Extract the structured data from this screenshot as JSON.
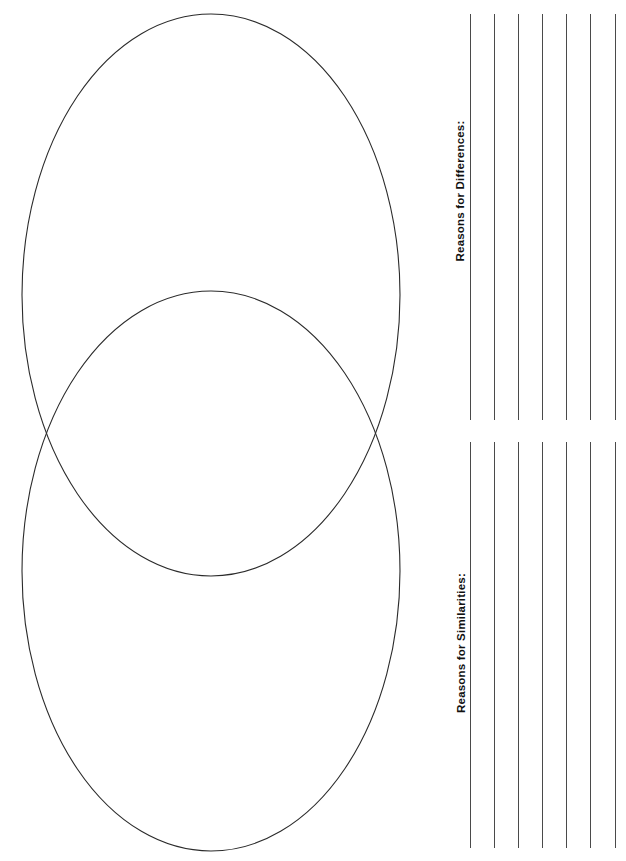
{
  "page": {
    "background_color": "#ffffff",
    "width": 626,
    "height": 861
  },
  "venn": {
    "name": "venn-diagram",
    "stroke_color": "#2b2b2b",
    "fill": "none",
    "stroke_width": 1.1,
    "ellipses": [
      {
        "id": "top-ellipse",
        "label": "",
        "cx": 211,
        "cy": 295,
        "rx": 189,
        "ry": 281
      },
      {
        "id": "bottom-ellipse",
        "label": "",
        "cx": 211,
        "cy": 571,
        "rx": 189,
        "ry": 280
      }
    ]
  },
  "writing_panel": {
    "sections": [
      {
        "id": "differences",
        "label": "Reasons for Differences:",
        "line_count": 7,
        "line_color": "#4a4a4a",
        "line_top": 14,
        "line_height": 406,
        "line_x_positions": [
          50,
          74,
          98,
          122,
          146,
          170,
          195
        ]
      },
      {
        "id": "similarities",
        "label": "Reasons for Similarities:",
        "line_count": 7,
        "line_color": "#4a4a4a",
        "line_top": 12,
        "line_height": 406,
        "line_x_positions": [
          50,
          74,
          98,
          122,
          146,
          170,
          195
        ]
      }
    ]
  }
}
